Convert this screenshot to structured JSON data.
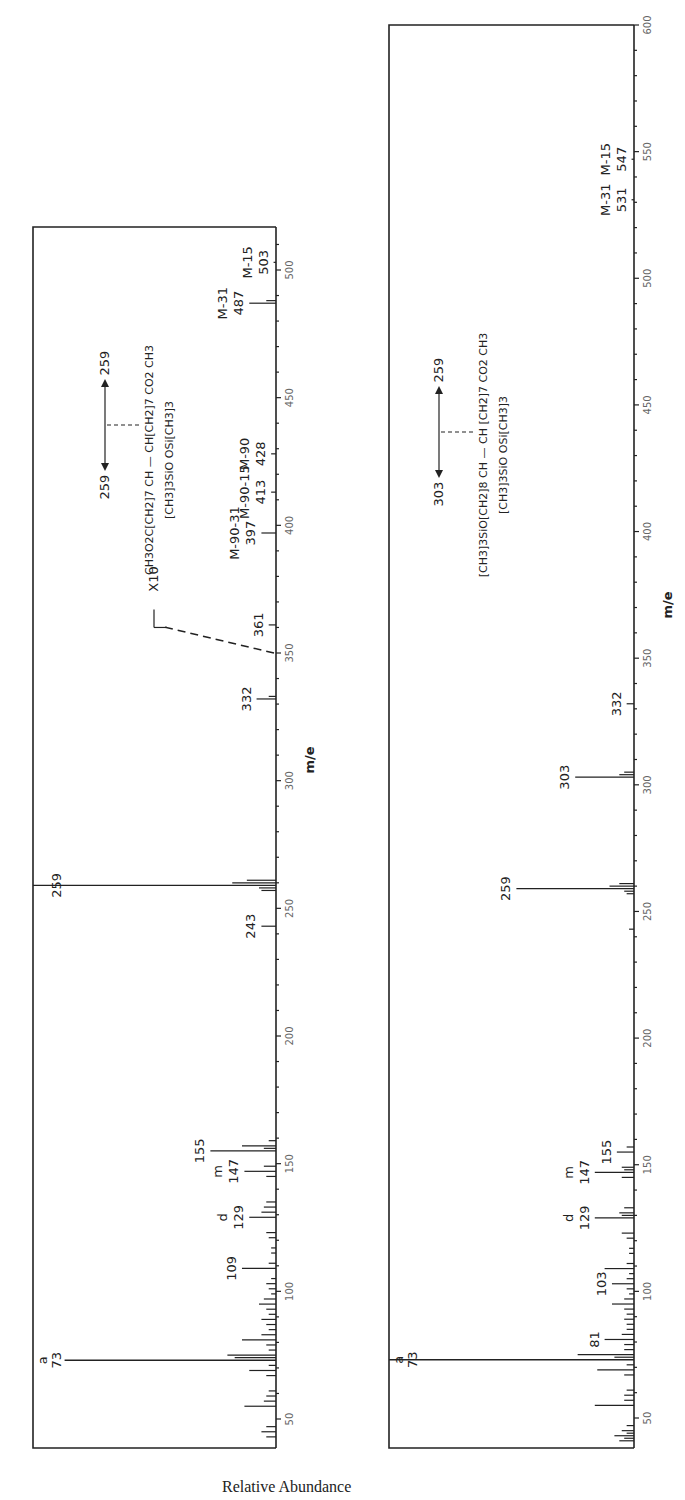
{
  "figure": {
    "y_axis_label": "Relative Abundance",
    "x_axis_label": "m/e",
    "ink_color": "#222222",
    "tick_color": "#666666"
  },
  "chart_data": [
    {
      "type": "bar",
      "panel": "top",
      "title": "",
      "xlabel": "m/e",
      "ylabel": "Relative Abundance",
      "xlim": [
        40,
        520
      ],
      "ylim": [
        0,
        100
      ],
      "x_ticks": [
        50,
        100,
        150,
        200,
        250,
        300,
        350,
        400,
        450,
        500
      ],
      "structure": {
        "line1": "CH3O2C[CH2]7 CH — CH[CH2]7 CO2 CH3",
        "line2": "[CH3]3SiO        OSi[CH3]3",
        "cleavage_left": "259",
        "cleavage_right": "259"
      },
      "annotation_x10": "X10",
      "peaks": [
        {
          "mz": 43,
          "value": 4
        },
        {
          "mz": 45,
          "value": 6
        },
        {
          "mz": 47,
          "value": 4
        },
        {
          "mz": 55,
          "value": 13
        },
        {
          "mz": 57,
          "value": 5
        },
        {
          "mz": 59,
          "value": 4
        },
        {
          "mz": 61,
          "value": 3
        },
        {
          "mz": 67,
          "value": 4
        },
        {
          "mz": 69,
          "value": 11
        },
        {
          "mz": 71,
          "value": 3
        },
        {
          "mz": 73,
          "value": 87,
          "label": "73",
          "sublabel": "a"
        },
        {
          "mz": 74,
          "value": 17
        },
        {
          "mz": 75,
          "value": 20
        },
        {
          "mz": 77,
          "value": 3
        },
        {
          "mz": 79,
          "value": 4
        },
        {
          "mz": 81,
          "value": 14
        },
        {
          "mz": 83,
          "value": 6
        },
        {
          "mz": 85,
          "value": 3
        },
        {
          "mz": 87,
          "value": 4
        },
        {
          "mz": 89,
          "value": 6
        },
        {
          "mz": 91,
          "value": 3
        },
        {
          "mz": 93,
          "value": 4
        },
        {
          "mz": 95,
          "value": 7
        },
        {
          "mz": 97,
          "value": 5
        },
        {
          "mz": 99,
          "value": 2
        },
        {
          "mz": 101,
          "value": 3
        },
        {
          "mz": 103,
          "value": 4
        },
        {
          "mz": 105,
          "value": 2
        },
        {
          "mz": 109,
          "value": 14,
          "label": "109"
        },
        {
          "mz": 111,
          "value": 3
        },
        {
          "mz": 115,
          "value": 2
        },
        {
          "mz": 117,
          "value": 2
        },
        {
          "mz": 121,
          "value": 3
        },
        {
          "mz": 123,
          "value": 4
        },
        {
          "mz": 129,
          "value": 11,
          "label": "129",
          "sublabel": "d"
        },
        {
          "mz": 131,
          "value": 6
        },
        {
          "mz": 133,
          "value": 5
        },
        {
          "mz": 135,
          "value": 4
        },
        {
          "mz": 145,
          "value": 4
        },
        {
          "mz": 147,
          "value": 13,
          "label": "147",
          "sublabel": "m"
        },
        {
          "mz": 149,
          "value": 5
        },
        {
          "mz": 155,
          "value": 27,
          "label": "155"
        },
        {
          "mz": 156,
          "value": 5
        },
        {
          "mz": 157,
          "value": 14
        },
        {
          "mz": 159,
          "value": 3
        },
        {
          "mz": 243,
          "value": 6,
          "label": "243"
        },
        {
          "mz": 257,
          "value": 6
        },
        {
          "mz": 258,
          "value": 7
        },
        {
          "mz": 259,
          "value": 100,
          "label": "259"
        },
        {
          "mz": 260,
          "value": 18
        },
        {
          "mz": 261,
          "value": 12
        },
        {
          "mz": 332,
          "value": 8,
          "label": "332"
        },
        {
          "mz": 333,
          "value": 3
        },
        {
          "mz": 361,
          "value": 3,
          "label": "361"
        },
        {
          "mz": 397,
          "value": 6,
          "label": "397",
          "sublabel": "M-90-31"
        },
        {
          "mz": 413,
          "value": 2,
          "label": "413",
          "sublabel": "M-90-15"
        },
        {
          "mz": 428,
          "value": 2,
          "label": "428",
          "sublabel": "M-90"
        },
        {
          "mz": 487,
          "value": 11,
          "label": "487",
          "sublabel": "M-31"
        },
        {
          "mz": 488,
          "value": 4
        },
        {
          "mz": 503,
          "value": 1,
          "label": "503",
          "sublabel": "M-15"
        }
      ]
    },
    {
      "type": "bar",
      "panel": "bottom",
      "title": "",
      "xlabel": "m/e",
      "ylabel": "Relative Abundance",
      "xlim": [
        40,
        600
      ],
      "ylim": [
        0,
        100
      ],
      "x_ticks": [
        50,
        100,
        150,
        200,
        250,
        300,
        350,
        400,
        450,
        500,
        550,
        600
      ],
      "structure": {
        "line1": "[CH3]3SiO[CH2]8 CH — CH [CH2]7 CO2 CH3",
        "line2": "[CH3]3SiO        OSi[CH3]3",
        "cleavage_left": "303",
        "cleavage_right": "259"
      },
      "peaks": [
        {
          "mz": 41,
          "value": 6
        },
        {
          "mz": 42,
          "value": 4
        },
        {
          "mz": 43,
          "value": 8
        },
        {
          "mz": 44,
          "value": 3
        },
        {
          "mz": 45,
          "value": 5
        },
        {
          "mz": 47,
          "value": 3
        },
        {
          "mz": 55,
          "value": 16
        },
        {
          "mz": 57,
          "value": 4
        },
        {
          "mz": 59,
          "value": 4
        },
        {
          "mz": 61,
          "value": 3
        },
        {
          "mz": 67,
          "value": 4
        },
        {
          "mz": 69,
          "value": 15
        },
        {
          "mz": 71,
          "value": 3
        },
        {
          "mz": 73,
          "value": 100,
          "label": "73",
          "sublabel": "a"
        },
        {
          "mz": 74,
          "value": 8
        },
        {
          "mz": 75,
          "value": 23
        },
        {
          "mz": 77,
          "value": 4
        },
        {
          "mz": 79,
          "value": 4
        },
        {
          "mz": 81,
          "value": 12,
          "label": "81"
        },
        {
          "mz": 83,
          "value": 5
        },
        {
          "mz": 85,
          "value": 3
        },
        {
          "mz": 87,
          "value": 3
        },
        {
          "mz": 89,
          "value": 4
        },
        {
          "mz": 91,
          "value": 3
        },
        {
          "mz": 93,
          "value": 4
        },
        {
          "mz": 95,
          "value": 9
        },
        {
          "mz": 97,
          "value": 4
        },
        {
          "mz": 99,
          "value": 2
        },
        {
          "mz": 101,
          "value": 3
        },
        {
          "mz": 103,
          "value": 9,
          "label": "103"
        },
        {
          "mz": 105,
          "value": 3
        },
        {
          "mz": 107,
          "value": 2
        },
        {
          "mz": 109,
          "value": 12
        },
        {
          "mz": 111,
          "value": 3
        },
        {
          "mz": 115,
          "value": 2
        },
        {
          "mz": 117,
          "value": 2
        },
        {
          "mz": 121,
          "value": 3
        },
        {
          "mz": 123,
          "value": 5
        },
        {
          "mz": 129,
          "value": 16,
          "label": "129",
          "sublabel": "d"
        },
        {
          "mz": 130,
          "value": 5
        },
        {
          "mz": 131,
          "value": 6
        },
        {
          "mz": 133,
          "value": 4
        },
        {
          "mz": 145,
          "value": 5
        },
        {
          "mz": 147,
          "value": 16,
          "label": "147",
          "sublabel": "m"
        },
        {
          "mz": 148,
          "value": 4
        },
        {
          "mz": 149,
          "value": 5
        },
        {
          "mz": 155,
          "value": 7,
          "label": "155"
        },
        {
          "mz": 157,
          "value": 3
        },
        {
          "mz": 243,
          "value": 2
        },
        {
          "mz": 257,
          "value": 3
        },
        {
          "mz": 258,
          "value": 4
        },
        {
          "mz": 259,
          "value": 48,
          "label": "259"
        },
        {
          "mz": 260,
          "value": 10
        },
        {
          "mz": 261,
          "value": 6
        },
        {
          "mz": 303,
          "value": 24,
          "label": "303"
        },
        {
          "mz": 304,
          "value": 6
        },
        {
          "mz": 305,
          "value": 4
        },
        {
          "mz": 332,
          "value": 3,
          "label": "332"
        },
        {
          "mz": 531,
          "value": 1,
          "label": "531",
          "sublabel": "M-31"
        },
        {
          "mz": 547,
          "value": 1,
          "label": "547",
          "sublabel": "M-15"
        }
      ]
    }
  ]
}
